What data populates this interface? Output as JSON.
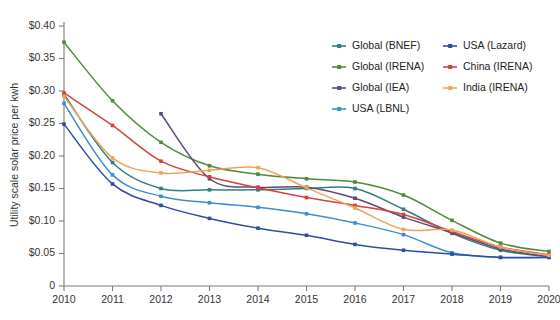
{
  "chart_data": {
    "type": "line",
    "title": "",
    "xlabel": "",
    "ylabel": "Utility scale solar price per kwh",
    "x": [
      2010,
      2011,
      2012,
      2013,
      2014,
      2015,
      2016,
      2017,
      2018,
      2019,
      2020
    ],
    "xtick_labels": [
      "2010",
      "2011",
      "2012",
      "2013",
      "2014",
      "2015",
      "2016",
      "2017",
      "2018",
      "2019",
      "2020"
    ],
    "ytick_labels": [
      "0",
      "$0.05",
      "$0.10",
      "$0.15",
      "$0.20",
      "$0.25",
      "$0.30",
      "$0.35",
      "$0.40"
    ],
    "ytick_values": [
      0,
      0.05,
      0.1,
      0.15,
      0.2,
      0.25,
      0.3,
      0.35,
      0.4
    ],
    "xlim": [
      2010,
      2020
    ],
    "ylim": [
      0,
      0.4
    ],
    "grid": false,
    "legend_position": "top-right",
    "series": [
      {
        "name": "Global (BNEF)",
        "color": "#2f7f7c",
        "x": [
          2010,
          2011,
          2012,
          2013,
          2014,
          2015,
          2016,
          2017,
          2018,
          2019,
          2020
        ],
        "values": [
          0.295,
          0.19,
          0.15,
          0.148,
          0.148,
          0.15,
          0.15,
          0.118,
          0.081,
          0.055,
          0.045
        ]
      },
      {
        "name": "Global (IRENA)",
        "color": "#4f8a3d",
        "x": [
          2010,
          2011,
          2012,
          2013,
          2014,
          2015,
          2016,
          2017,
          2018,
          2019,
          2020
        ],
        "values": [
          0.375,
          0.285,
          0.221,
          0.185,
          0.172,
          0.165,
          0.16,
          0.14,
          0.101,
          0.066,
          0.053
        ]
      },
      {
        "name": "Global (IEA)",
        "color": "#5e4a73",
        "x": [
          2012,
          2013,
          2014,
          2015,
          2016,
          2017,
          2018,
          2019,
          2020
        ],
        "values": [
          0.265,
          0.165,
          0.152,
          0.152,
          0.135,
          0.106,
          0.082,
          0.057,
          0.045
        ]
      },
      {
        "name": "USA (LBNL)",
        "color": "#3a8fd0",
        "x": [
          2010,
          2011,
          2012,
          2013,
          2014,
          2015,
          2016,
          2017,
          2018,
          2019,
          2020
        ],
        "values": [
          0.281,
          0.171,
          0.138,
          0.128,
          0.121,
          0.111,
          0.097,
          0.079,
          0.051,
          0.044,
          0.044
        ]
      },
      {
        "name": "USA (Lazard)",
        "color": "#2e4f9e",
        "x": [
          2010,
          2011,
          2012,
          2013,
          2014,
          2015,
          2016,
          2017,
          2018,
          2019,
          2020
        ],
        "values": [
          0.249,
          0.157,
          0.124,
          0.104,
          0.089,
          0.078,
          0.064,
          0.055,
          0.049,
          0.044,
          0.044
        ]
      },
      {
        "name": "China (IRENA)",
        "color": "#d0433f",
        "x": [
          2010,
          2011,
          2012,
          2013,
          2014,
          2015,
          2016,
          2017,
          2018,
          2019,
          2020
        ],
        "values": [
          0.297,
          0.247,
          0.192,
          0.168,
          0.151,
          0.136,
          0.124,
          0.11,
          0.084,
          0.06,
          0.048
        ]
      },
      {
        "name": "India (IRENA)",
        "color": "#eda45a",
        "x": [
          2010,
          2011,
          2012,
          2013,
          2014,
          2015,
          2016,
          2017,
          2018,
          2019,
          2020
        ],
        "values": [
          0.292,
          0.197,
          0.174,
          0.178,
          0.182,
          0.151,
          0.12,
          0.087,
          0.086,
          0.06,
          0.047
        ]
      }
    ]
  },
  "legend": {
    "entries": [
      {
        "label": "Global (BNEF)",
        "color": "#2f7f7c",
        "col": 0,
        "row": 0
      },
      {
        "label": "Global (IRENA)",
        "color": "#4f8a3d",
        "col": 0,
        "row": 1
      },
      {
        "label": "Global (IEA)",
        "color": "#5e4a73",
        "col": 0,
        "row": 2
      },
      {
        "label": "USA (LBNL)",
        "color": "#3a8fd0",
        "col": 0,
        "row": 3
      },
      {
        "label": "USA (Lazard)",
        "color": "#2e4f9e",
        "col": 1,
        "row": 0
      },
      {
        "label": "China (IRENA)",
        "color": "#d0433f",
        "col": 1,
        "row": 1
      },
      {
        "label": "India (IRENA)",
        "color": "#eda45a",
        "col": 1,
        "row": 2
      }
    ]
  },
  "colors": {
    "axis": "#7a7a7a",
    "text": "#333333",
    "background": "#ffffff"
  }
}
